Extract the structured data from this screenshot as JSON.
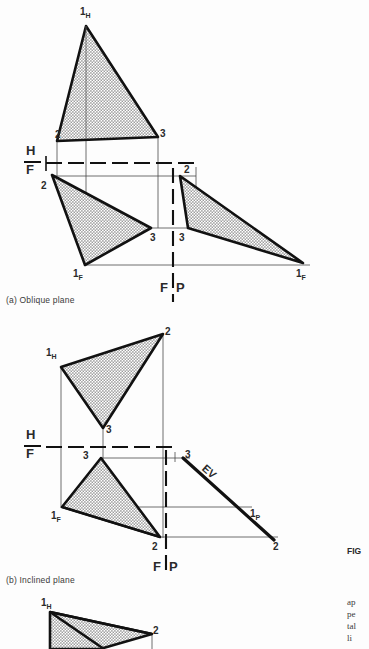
{
  "page": {
    "width": 369,
    "height": 649,
    "background": "#fdfdfd",
    "ink": "#1a1a1a",
    "hatch_fill": "#b5b5b5"
  },
  "figures": [
    {
      "id": "a",
      "caption": "(a) Oblique plane",
      "caption_pos": [
        6,
        296
      ],
      "fold_lines": [
        {
          "name": "h-f",
          "upper_label": "H",
          "lower_label": "F",
          "label_pos": [
            27,
            148
          ],
          "dash_y": 163,
          "dash_x1": 46,
          "dash_x2": 196
        },
        {
          "name": "f-p",
          "left_label": "F",
          "right_label": "P",
          "label_pos": [
            163,
            280
          ],
          "dash_x": 173,
          "dash_y1": 170,
          "dash_y2": 300
        }
      ],
      "views": [
        {
          "name": "top-view-horizontal",
          "vertices": [
            {
              "label": "1",
              "sub": "H",
              "x": 86,
              "y": 26,
              "lx": 80,
              "ly": 12
            },
            {
              "label": "2",
              "sub": "",
              "x": 57,
              "y": 141,
              "lx": 57,
              "ly": 130
            },
            {
              "label": "3",
              "sub": "",
              "x": 158,
              "y": 137,
              "lx": 161,
              "ly": 130
            }
          ]
        },
        {
          "name": "front-view",
          "vertices": [
            {
              "label": "2",
              "sub": "",
              "x": 52,
              "y": 175,
              "lx": 42,
              "ly": 183
            },
            {
              "label": "3",
              "sub": "",
              "x": 151,
              "y": 228,
              "lx": 152,
              "ly": 243
            },
            {
              "label": "1",
              "sub": "F",
              "x": 85,
              "y": 265,
              "lx": 74,
              "ly": 281
            }
          ]
        },
        {
          "name": "profile-view",
          "vertices": [
            {
              "label": "2",
              "sub": "",
              "x": 180,
              "y": 176,
              "lx": 185,
              "ly": 170
            },
            {
              "label": "3",
              "sub": "",
              "x": 188,
              "y": 228,
              "lx": 180,
              "ly": 243
            },
            {
              "label": "1",
              "sub": "F",
              "x": 303,
              "y": 263,
              "lx": 297,
              "ly": 281
            }
          ]
        }
      ]
    },
    {
      "id": "b",
      "caption": "(b) Inclined plane",
      "caption_pos": [
        6,
        576
      ],
      "edge_view_label": "EV",
      "fold_lines": [
        {
          "name": "h-f",
          "upper_label": "H",
          "lower_label": "F",
          "label_pos": [
            27,
            435
          ],
          "dash_y": 447,
          "dash_x1": 46,
          "dash_x2": 175
        },
        {
          "name": "f-p",
          "left_label": "F",
          "right_label": "P",
          "label_pos": [
            156,
            560
          ],
          "dash_x": 166,
          "dash_y1": 452,
          "dash_y2": 574
        }
      ],
      "views": [
        {
          "name": "top-view-horizontal",
          "vertices": [
            {
              "label": "1",
              "sub": "H",
              "x": 61,
              "y": 367,
              "lx": 47,
              "ly": 349
            },
            {
              "label": "2",
              "sub": "",
              "x": 163,
              "y": 334,
              "lx": 166,
              "ly": 328
            },
            {
              "label": "3",
              "sub": "",
              "x": 103,
              "y": 428,
              "lx": 107,
              "ly": 427
            }
          ]
        },
        {
          "name": "front-view",
          "vertices": [
            {
              "label": "3",
              "sub": "",
              "x": 101,
              "y": 458,
              "lx": 84,
              "ly": 455
            },
            {
              "label": "1",
              "sub": "F",
              "x": 62,
              "y": 507,
              "lx": 52,
              "ly": 523
            },
            {
              "label": "2",
              "sub": "",
              "x": 160,
              "y": 537,
              "lx": 153,
              "ly": 553
            }
          ]
        },
        {
          "name": "profile-edge-view",
          "vertices": [
            {
              "label": "3",
              "sub": "",
              "x": 183,
              "y": 458,
              "lx": 186,
              "ly": 453
            },
            {
              "label": "1",
              "sub": "P",
              "x": 247,
              "y": 515,
              "lx": 251,
              "ly": 517
            },
            {
              "label": "2",
              "sub": "",
              "x": 272,
              "y": 538,
              "lx": 274,
              "ly": 553
            }
          ]
        }
      ]
    },
    {
      "id": "c",
      "caption": "",
      "views": [
        {
          "name": "top-view-horizontal",
          "vertices": [
            {
              "label": "1",
              "sub": "H",
              "x": 50,
              "y": 612,
              "lx": 42,
              "ly": 600
            },
            {
              "label": "2",
              "sub": "",
              "x": 152,
              "y": 634,
              "lx": 154,
              "ly": 628
            }
          ]
        }
      ]
    }
  ],
  "sidebar_text": {
    "figure_label": "FIG",
    "body_lines": [
      "ap",
      "pe",
      "tal",
      "li"
    ]
  }
}
